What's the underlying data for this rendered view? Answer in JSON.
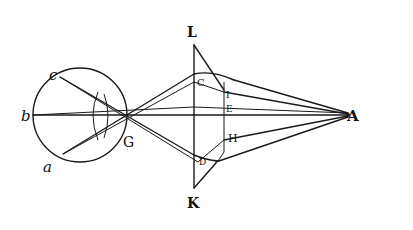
{
  "figure": {
    "labels": {
      "c": "c",
      "b": "b",
      "a": "a",
      "G": "G",
      "L": "L",
      "K": "K",
      "C": "C",
      "I": "I",
      "E": "E",
      "H": "H",
      "D": "D",
      "A": "A"
    },
    "colors": {
      "ink": "#1a1a1a",
      "paper": "#ffffff"
    }
  }
}
